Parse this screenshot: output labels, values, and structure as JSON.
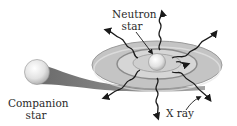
{
  "diagram": {
    "labels": {
      "neutron_star_line1": "Neutron",
      "neutron_star_line2": "star",
      "companion_line1": "Companion",
      "companion_line2": "star",
      "xray": "X ray"
    },
    "nodes": [
      {
        "id": "neutron-star",
        "label": "Neutron star"
      },
      {
        "id": "companion-star",
        "label": "Companion star"
      },
      {
        "id": "accretion-disk",
        "label": ""
      },
      {
        "id": "x-rays",
        "label": "X ray"
      }
    ],
    "edges": [
      {
        "from": "companion-star",
        "to": "accretion-disk",
        "kind": "mass-transfer-stream"
      },
      {
        "from": "neutron-star",
        "to": "x-rays",
        "kind": "emission"
      }
    ],
    "colors": {
      "disk_outer": "#c4c4c4",
      "disk_inner": "#d6d6d6",
      "disk_edge": "#9a9a9a",
      "stream": "#6e6e6e",
      "star_fill": "#eeeeee",
      "xray_line": "#1a1a1a"
    }
  }
}
